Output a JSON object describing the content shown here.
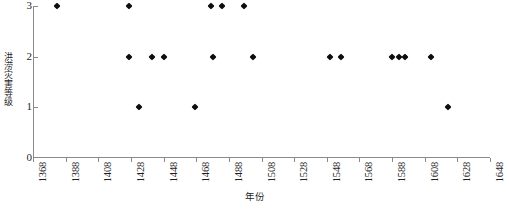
{
  "chart_data": {
    "type": "scatter",
    "title": "",
    "xlabel": "年份",
    "ylabel": "洪涝灾害等级",
    "xlim": [
      1368,
      1648
    ],
    "ylim": [
      0,
      3
    ],
    "grid": false,
    "legend": null,
    "marker": "diamond",
    "marker_color": "#0d0d0d",
    "xticks": [
      1368,
      1388,
      1408,
      1428,
      1448,
      1468,
      1488,
      1508,
      1528,
      1548,
      1568,
      1588,
      1608,
      1628,
      1648
    ],
    "xtick_labels": [
      "1368",
      "1388",
      "1408",
      "1428",
      "1448",
      "1468",
      "1488",
      "1508",
      "1528",
      "1548",
      "1568",
      "1588",
      "1608",
      "1628",
      "1648"
    ],
    "xtick_rotation": 90,
    "yticks": [
      0,
      1,
      2,
      3
    ],
    "ytick_labels": [
      "0",
      "1",
      "2",
      "3"
    ],
    "x": [
      1383,
      1427,
      1427,
      1433,
      1441,
      1448,
      1467,
      1477,
      1478,
      1484,
      1497,
      1503,
      1550,
      1557,
      1588,
      1592,
      1596,
      1612,
      1622
    ],
    "y": [
      3,
      3,
      2,
      1,
      2,
      2,
      1,
      3,
      2,
      3,
      3,
      2,
      2,
      2,
      2,
      2,
      2,
      2,
      1
    ],
    "points": [
      {
        "year": 1383,
        "level": 3
      },
      {
        "year": 1427,
        "level": 3
      },
      {
        "year": 1427,
        "level": 2
      },
      {
        "year": 1433,
        "level": 1
      },
      {
        "year": 1441,
        "level": 2
      },
      {
        "year": 1448,
        "level": 2
      },
      {
        "year": 1467,
        "level": 1
      },
      {
        "year": 1477,
        "level": 3
      },
      {
        "year": 1478,
        "level": 2
      },
      {
        "year": 1484,
        "level": 3
      },
      {
        "year": 1497,
        "level": 3
      },
      {
        "year": 1503,
        "level": 2
      },
      {
        "year": 1550,
        "level": 2
      },
      {
        "year": 1557,
        "level": 2
      },
      {
        "year": 1588,
        "level": 2
      },
      {
        "year": 1592,
        "level": 2
      },
      {
        "year": 1596,
        "level": 2
      },
      {
        "year": 1612,
        "level": 2
      },
      {
        "year": 1622,
        "level": 1
      }
    ]
  }
}
